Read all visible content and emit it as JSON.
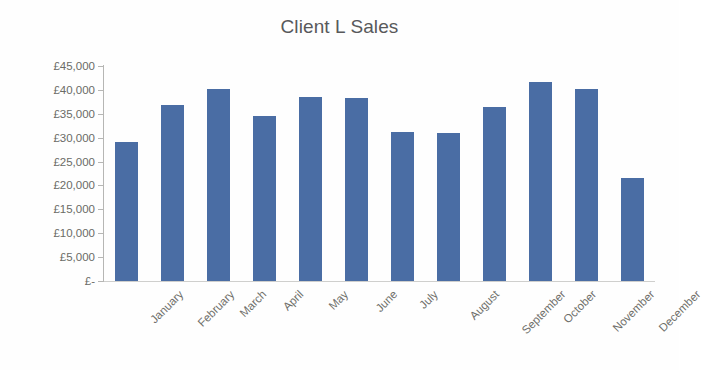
{
  "chart_data": {
    "type": "bar",
    "title": "Client L Sales",
    "xlabel": "",
    "ylabel": "",
    "categories": [
      "January",
      "February",
      "March",
      "April",
      "May",
      "June",
      "July",
      "August",
      "September",
      "October",
      "November",
      "December"
    ],
    "values": [
      29000,
      36800,
      40200,
      34600,
      38500,
      38400,
      31100,
      31000,
      36400,
      41600,
      40100,
      21500
    ],
    "series": [
      {
        "name": "Sales",
        "values": [
          29000,
          36800,
          40200,
          34600,
          38500,
          38400,
          31100,
          31000,
          36400,
          41600,
          40100,
          21500
        ]
      }
    ],
    "ylim": [
      0,
      45000
    ],
    "ytick_values": [
      45000,
      40000,
      35000,
      30000,
      25000,
      20000,
      15000,
      10000,
      5000,
      0
    ],
    "ytick_labels": [
      "£45,000",
      "£40,000",
      "£35,000",
      "£30,000",
      "£25,000",
      "£20,000",
      "£15,000",
      "£10,000",
      "£5,000",
      "£-"
    ],
    "grid": false,
    "legend": false,
    "legend_position": "none",
    "currency_symbol": "£",
    "bar_color": "#4a6da4",
    "axis_color": "#b6b6b4",
    "text_color": "#6a6b66",
    "title_color": "#58595b",
    "background_color": "#fefefe"
  }
}
